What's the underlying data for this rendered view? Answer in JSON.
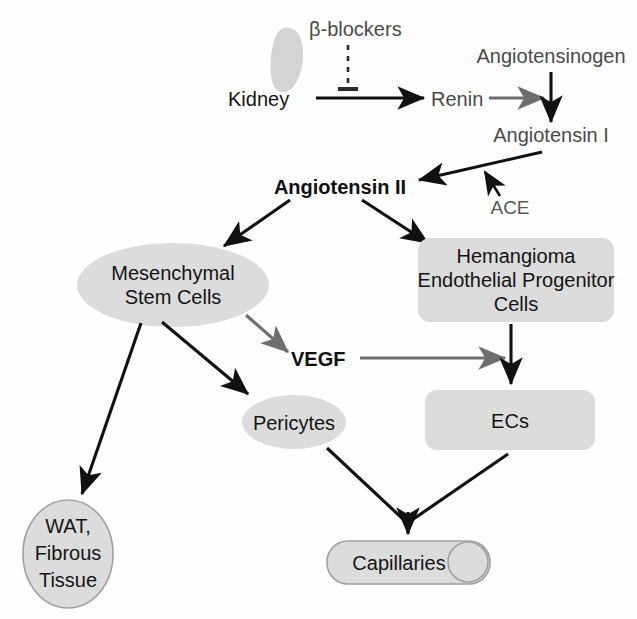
{
  "figure": {
    "type": "flow-diagram",
    "background_color": "#ffffff",
    "shape_fill_color": "#dcdcdc",
    "shape_outline_color": "#a0a0a0",
    "arrow_black_color": "#111111",
    "arrow_gray_color": "#6e6e6e"
  },
  "nodes": {
    "kidney_icon": {
      "name": "kidney",
      "shape": "bean-blob",
      "color": "#d2d2d2"
    },
    "beta_blockers": {
      "label": "β-blockers",
      "style": "gray-text"
    },
    "kidney": {
      "label": "Kidney",
      "style": "black-text"
    },
    "renin": {
      "label": "Renin",
      "style": "gray-text"
    },
    "angiotensinogen": {
      "label": "Angiotensinogen",
      "style": "gray-text"
    },
    "angiotensin_i": {
      "label": "Angiotensin I",
      "style": "gray-text"
    },
    "angiotensin_ii": {
      "label": "Angiotensin II",
      "style": "bold-black-text"
    },
    "ace": {
      "label": "ACE",
      "style": "gray-text"
    },
    "mesenchymal_stem_cells": {
      "line1": "Mesenchymal",
      "line2": "Stem Cells",
      "shape": "ellipse"
    },
    "hemangioma_epc": {
      "line1": "Hemangioma",
      "line2": "Endothelial Progenitor",
      "line3": "Cells",
      "shape": "rounded-rect"
    },
    "vegf": {
      "label": "VEGF",
      "style": "bold-black-text"
    },
    "pericytes": {
      "label": "Pericytes",
      "shape": "ellipse"
    },
    "ecs": {
      "label": "ECs",
      "shape": "rounded-rect"
    },
    "wat_fibrous": {
      "line1": "WAT,",
      "line2": "Fibrous",
      "line3": "Tissue",
      "shape": "ellipse-outlined"
    },
    "capillaries": {
      "label": "Capillaries",
      "shape": "cylinder"
    }
  },
  "edges": [
    {
      "from": "kidney",
      "to": "renin",
      "style": "black-arrow"
    },
    {
      "from": "beta_blockers",
      "to": "kidney-renin-edge",
      "style": "dashed-inhibition"
    },
    {
      "from": "renin",
      "to": "angiotensinogen-axis",
      "style": "gray-arrow"
    },
    {
      "from": "angiotensinogen",
      "to": "angiotensin_i",
      "style": "black-arrow"
    },
    {
      "from": "angiotensin_i",
      "to": "angiotensin_ii",
      "style": "black-arrow"
    },
    {
      "from": "ace",
      "to": "angiotensin_i-conversion",
      "style": "black-arrow"
    },
    {
      "from": "angiotensin_ii",
      "to": "mesenchymal_stem_cells",
      "style": "black-arrow"
    },
    {
      "from": "angiotensin_ii",
      "to": "hemangioma_epc",
      "style": "black-arrow"
    },
    {
      "from": "mesenchymal_stem_cells",
      "to": "vegf",
      "style": "gray-arrow"
    },
    {
      "from": "mesenchymal_stem_cells",
      "to": "pericytes",
      "style": "black-arrow"
    },
    {
      "from": "mesenchymal_stem_cells",
      "to": "wat_fibrous",
      "style": "black-arrow"
    },
    {
      "from": "vegf",
      "to": "ecs",
      "style": "gray-arrow"
    },
    {
      "from": "hemangioma_epc",
      "to": "ecs",
      "style": "black-arrow"
    },
    {
      "from": "pericytes",
      "to": "capillaries",
      "style": "black-arrow"
    },
    {
      "from": "ecs",
      "to": "capillaries",
      "style": "black-arrow"
    }
  ]
}
